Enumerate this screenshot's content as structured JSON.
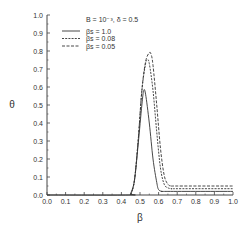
{
  "chart_data": {
    "type": "line",
    "title": "",
    "xlabel": "β",
    "ylabel": "θ",
    "xlim": [
      0.0,
      1.0
    ],
    "ylim": [
      0.0,
      1.0
    ],
    "xticks": [
      "0.0",
      "0.1",
      "0.2",
      "0.3",
      "0.4",
      "0.5",
      "0.6",
      "0.7",
      "0.8",
      "0.9",
      "1.0"
    ],
    "yticks": [
      "0.0",
      "0.1",
      "0.2",
      "0.3",
      "0.4",
      "0.5",
      "0.6",
      "0.7",
      "0.8",
      "0.9",
      "1.0"
    ],
    "grid": false,
    "legend_position": "upper-center",
    "annotation": "B = 10⁻³, δ = 0.5",
    "series": [
      {
        "name": "βs = 1.0",
        "style": "solid",
        "x": [
          0.0,
          0.44,
          0.45,
          0.47,
          0.49,
          0.51,
          0.52,
          0.53,
          0.55,
          0.57,
          0.59,
          0.6,
          0.62,
          0.65,
          1.0
        ],
        "y": [
          0.0,
          0.0,
          0.01,
          0.08,
          0.28,
          0.5,
          0.58,
          0.56,
          0.4,
          0.2,
          0.07,
          0.03,
          0.02,
          0.02,
          0.02
        ]
      },
      {
        "name": "βs = 0.08",
        "style": "dashed",
        "x": [
          0.45,
          0.47,
          0.49,
          0.51,
          0.53,
          0.54,
          0.55,
          0.57,
          0.59,
          0.61,
          0.63,
          0.65,
          0.67,
          0.7,
          1.0
        ],
        "y": [
          0.0,
          0.08,
          0.3,
          0.58,
          0.73,
          0.75,
          0.73,
          0.58,
          0.35,
          0.15,
          0.06,
          0.04,
          0.035,
          0.035,
          0.035
        ]
      },
      {
        "name": "βs = 0.05",
        "style": "dash-dot",
        "x": [
          0.45,
          0.47,
          0.49,
          0.51,
          0.53,
          0.55,
          0.56,
          0.57,
          0.59,
          0.61,
          0.63,
          0.65,
          0.67,
          0.7,
          1.0
        ],
        "y": [
          0.0,
          0.08,
          0.3,
          0.58,
          0.74,
          0.79,
          0.78,
          0.72,
          0.5,
          0.26,
          0.11,
          0.06,
          0.05,
          0.05,
          0.05
        ]
      }
    ]
  }
}
